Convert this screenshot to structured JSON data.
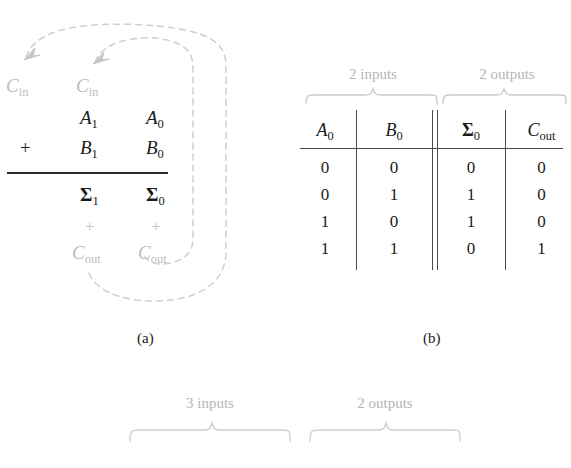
{
  "figure": {
    "panel_a": {
      "caption": "(a)",
      "carry_in_labels": [
        {
          "base": "C",
          "sub": "in"
        },
        {
          "base": "C",
          "sub": "in"
        }
      ],
      "operator": "+",
      "rows": [
        {
          "col1": {
            "base": "A",
            "sub": "1"
          },
          "col0": {
            "base": "A",
            "sub": "0"
          }
        },
        {
          "col1": {
            "base": "B",
            "sub": "1"
          },
          "col0": {
            "base": "B",
            "sub": "0"
          }
        }
      ],
      "sum_row": {
        "col1": {
          "base": "Σ",
          "sub": "1"
        },
        "col0": {
          "base": "Σ",
          "sub": "0"
        }
      },
      "carry_plus": [
        "+",
        "+"
      ],
      "carry_out_labels": [
        {
          "base": "C",
          "sub": "out"
        },
        {
          "base": "C",
          "sub": "out"
        }
      ]
    },
    "panel_b": {
      "caption": "(b)",
      "group_labels": [
        "2 inputs",
        "2 outputs"
      ],
      "headers": [
        {
          "base": "A",
          "sub": "0",
          "style": "italic"
        },
        {
          "base": "B",
          "sub": "0",
          "style": "italic"
        },
        {
          "base": "Σ",
          "sub": "0",
          "style": "bold"
        },
        {
          "base": "C",
          "sub": "out",
          "style": "italic"
        }
      ],
      "rows": [
        [
          "0",
          "0",
          "0",
          "0"
        ],
        [
          "0",
          "1",
          "1",
          "0"
        ],
        [
          "1",
          "0",
          "1",
          "0"
        ],
        [
          "1",
          "1",
          "0",
          "1"
        ]
      ]
    },
    "panel_c": {
      "group_labels": [
        "3 inputs",
        "2 outputs"
      ]
    }
  },
  "colors": {
    "ink": "#1a1a1a",
    "rule": "#4a4a4a",
    "faded": "#bdbdbd",
    "brace": "#c9c9c9",
    "dashed": "#cfcfcf"
  }
}
